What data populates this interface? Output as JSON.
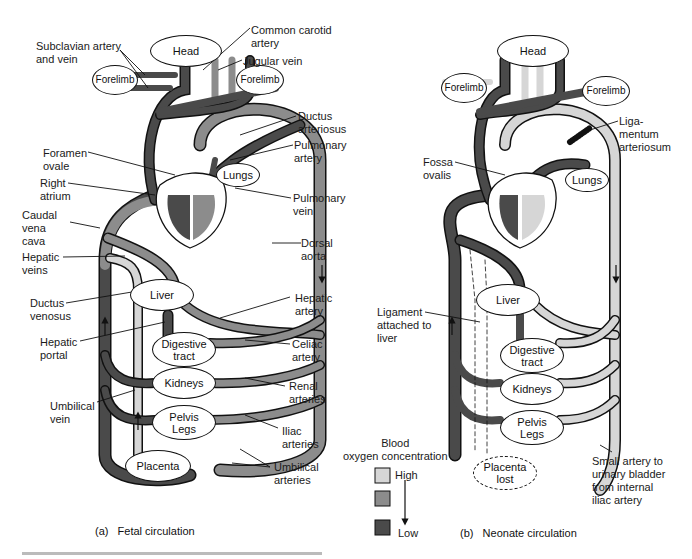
{
  "colors": {
    "high_oxygen": "#d6d6d6",
    "medium_oxygen": "#8c8c8c",
    "low_oxygen": "#4a4a4a",
    "outline": "#111111"
  },
  "fetal": {
    "caption": "(a)   Fetal circulation",
    "organs": {
      "head": "Head",
      "forelimb_left": "Forelimb",
      "forelimb_right": "Forelimb",
      "lungs": "Lungs",
      "liver": "Liver",
      "digestive": "Digestive\ntract",
      "kidneys": "Kidneys",
      "pelvis": "Pelvis\nLegs",
      "placenta": "Placenta"
    },
    "labels": {
      "subclavian": "Subclavian artery\nand vein",
      "carotid": "Common carotid\nartery",
      "jugular": "Jugular vein",
      "ductus_arteriosus": "Ductus\narteriosus",
      "foramen_ovale": "Foramen\novale",
      "pulmonary_artery": "Pulmonary\nartery",
      "right_atrium": "Right\natrium",
      "pulmonary_vein": "Pulmonary\nvein",
      "caudal_vena_cava": "Caudal\nvena\ncava",
      "dorsal_aorta": "Dorsal\naorta",
      "hepatic_veins": "Hepatic\nveins",
      "ductus_venosus": "Ductus\nvenosus",
      "hepatic_artery": "Hepatic\nartery",
      "hepatic_portal": "Hepatic\nportal",
      "celiac_artery": "Celiac\nartery",
      "renal_arteries": "Renal\narteries",
      "umbilical_vein": "Umbilical\nvein",
      "iliac_arteries": "Iliac\narteries",
      "umbilical_arteries": "Umbilical\narteries"
    }
  },
  "neonate": {
    "caption": "(b)   Neonate circulation",
    "organs": {
      "head": "Head",
      "forelimb_left": "Forelimb",
      "forelimb_right": "Forelimb",
      "lungs": "Lungs",
      "liver": "Liver",
      "digestive": "Digestive\ntract",
      "kidneys": "Kidneys",
      "pelvis": "Pelvis\nLegs",
      "placenta": "Placenta\nlost"
    },
    "labels": {
      "ligamentum": "Liga-\nmentum\narteriosum",
      "fossa_ovalis": "Fossa\novalis",
      "ligament_liver": "Ligament\nattached to\nliver",
      "small_artery": "Small artery to\nurinary bladder\nfrom internal\niliac artery"
    }
  },
  "legend": {
    "title": "Blood\noxygen concentration",
    "high": "High",
    "low": "Low"
  }
}
